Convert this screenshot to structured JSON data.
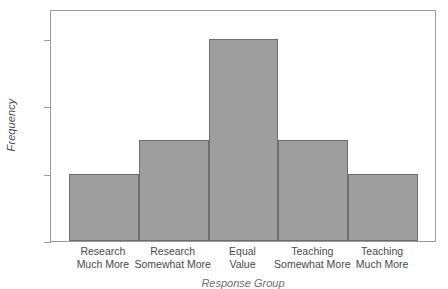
{
  "chart_data": {
    "type": "bar",
    "title": "",
    "xlabel": "Response Group",
    "ylabel": "Frequency",
    "categories": [
      "Research\nMuch More",
      "Research\nSomewhat More",
      "Equal\nValue",
      "Teaching\nSomewhat More",
      "Teaching\nMuch More"
    ],
    "values": [
      50,
      75,
      150,
      75,
      50
    ],
    "ylim": [
      0,
      172
    ],
    "yticks": [
      0,
      50,
      100,
      150
    ],
    "ytick_labels": [
      "0",
      "50",
      "100",
      "150"
    ],
    "grid": false,
    "legend": "none",
    "bar_color": "#9e9e9e",
    "bar_edge_color": "#6d6d6d",
    "axis_color": "#9a9a9a",
    "text_color": "#4a4a4a"
  }
}
